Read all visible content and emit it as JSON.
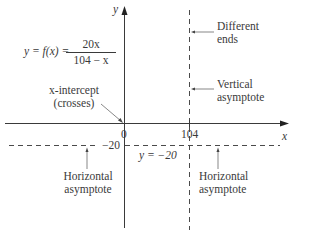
{
  "diagram": {
    "function": {
      "lhs": "y = f(x) =",
      "numerator": "20x",
      "denominator": "104 − x"
    },
    "axes": {
      "x_label": "x",
      "y_label": "y",
      "origin_label": "0",
      "x_tick_label": "104",
      "y_tick_label": "−20"
    },
    "annotations": {
      "different_ends": [
        "Different",
        "ends"
      ],
      "vertical_asymptote": [
        "Vertical",
        "asymptote"
      ],
      "x_intercept": [
        "x-intercept",
        "(crosses)"
      ],
      "horizontal_asymptote_left": [
        "Horizontal",
        "asymptote"
      ],
      "horizontal_asymptote_right": [
        "Horizontal",
        "asymptote"
      ],
      "h_asymptote_equation": "y = −20"
    },
    "colors": {
      "ink": "#3a3a3a",
      "dashed": "#4a4a4a"
    }
  }
}
